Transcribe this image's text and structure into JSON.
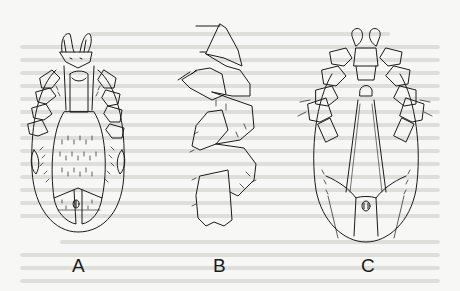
{
  "figure": {
    "panels": [
      {
        "id": "A",
        "label": "A",
        "subject": "mite-dorsal-view"
      },
      {
        "id": "B",
        "label": "B",
        "subject": "mite-leg-segments"
      },
      {
        "id": "C",
        "label": "C",
        "subject": "mite-ventral-view"
      }
    ],
    "colors": {
      "background": "#f7f7f5",
      "ink": "#1a1a1a",
      "bleed_text": "#d4d4d2"
    }
  }
}
